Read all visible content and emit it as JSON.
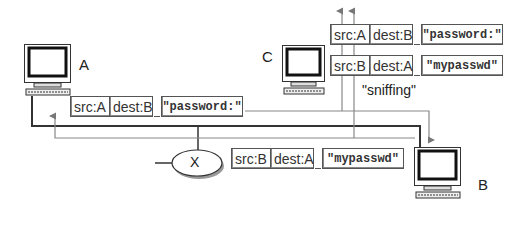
{
  "diagram": {
    "hosts": [
      {
        "id": "A",
        "label": "A"
      },
      {
        "id": "B",
        "label": "B"
      },
      {
        "id": "C",
        "label": "C"
      }
    ],
    "hub": {
      "label": "X"
    },
    "annotation": "\"sniffing\"",
    "packets": {
      "a_to_b": {
        "src": "src:A",
        "dest": "dest:B",
        "payload": "\"password:\""
      },
      "b_to_a": {
        "src": "src:B",
        "dest": "dest:A",
        "payload": "\"mypasswd\""
      },
      "sniffed_1": {
        "src": "src:A",
        "dest": "dest:B",
        "payload": "\"password:\""
      },
      "sniffed_2": {
        "src": "src:B",
        "dest": "dest:A",
        "payload": "\"mypasswd\""
      }
    }
  }
}
